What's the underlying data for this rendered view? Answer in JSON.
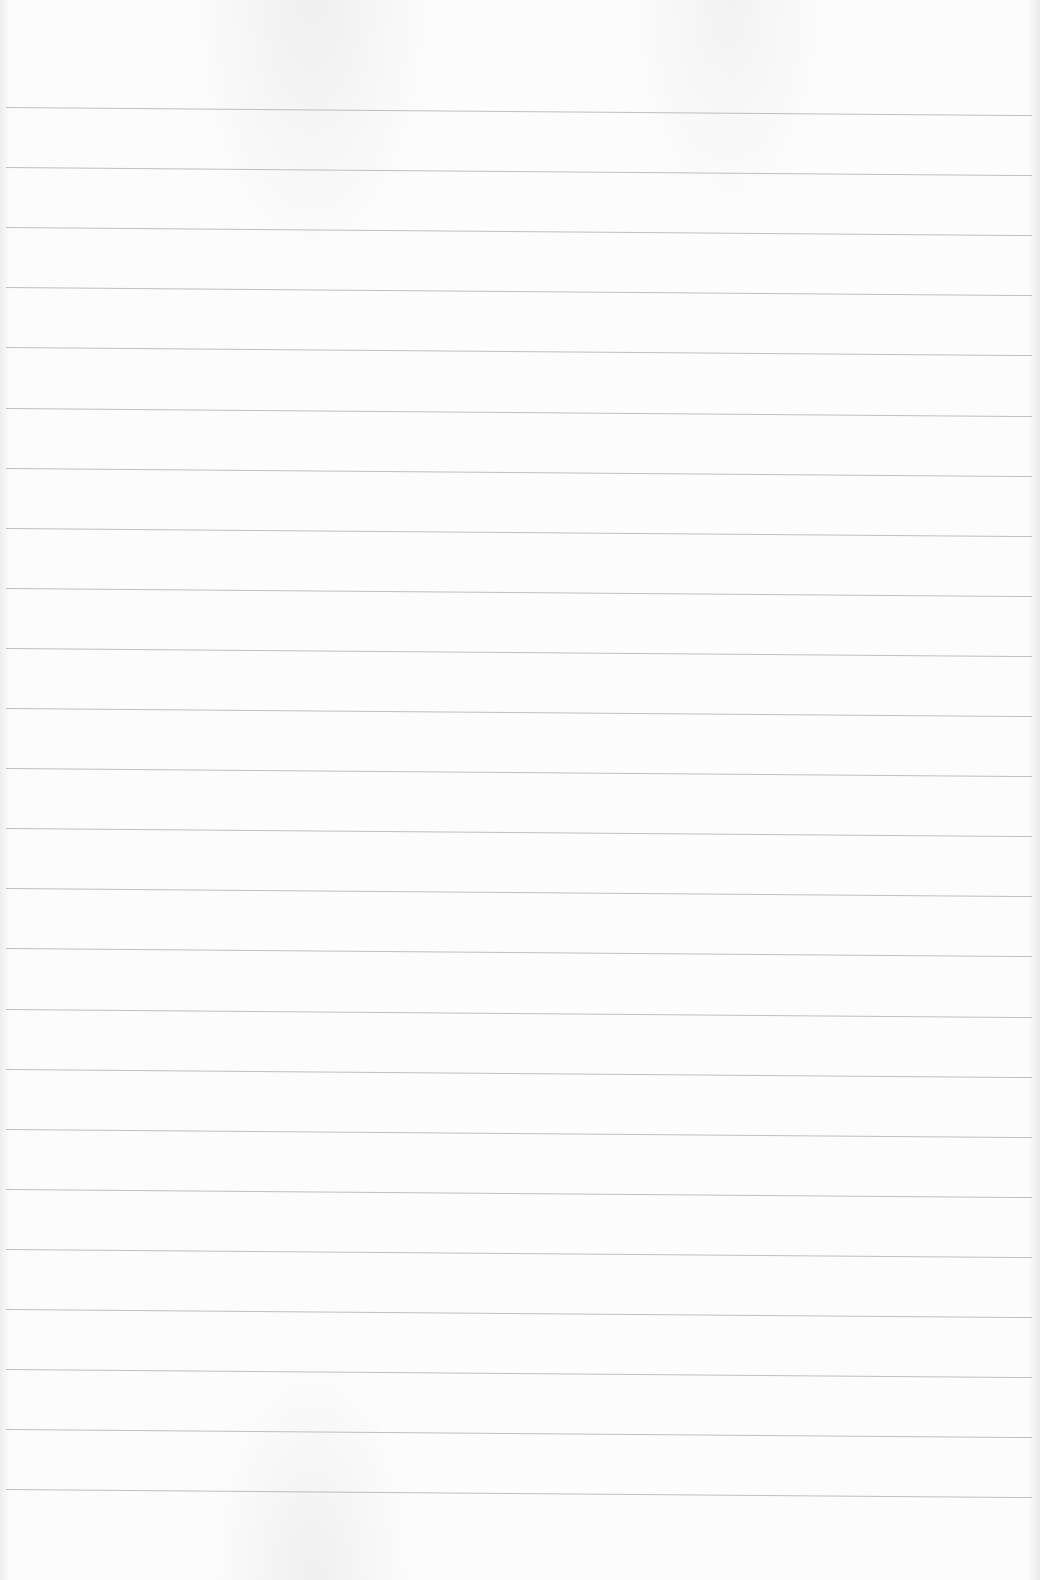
{
  "document": {
    "type": "blank ruled paper",
    "line_count": 24,
    "first_line_y": 107,
    "line_spacing": 60.1,
    "line_color": "#b4b4b4",
    "paper_color": "#fcfcfc"
  }
}
